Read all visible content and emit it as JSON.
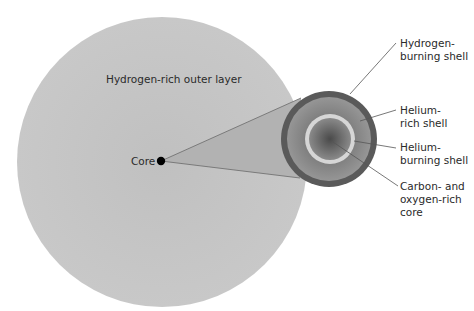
{
  "diagram": {
    "outer_layer_label": "Hydrogen-rich outer layer",
    "core_label": "Core",
    "callouts": [
      {
        "line1": "Hydrogen-",
        "line2": "burning shell",
        "line3": ""
      },
      {
        "line1": "Helium-",
        "line2": "rich shell",
        "line3": ""
      },
      {
        "line1": "Helium-",
        "line2": "burning shell",
        "line3": ""
      },
      {
        "line1": "Carbon- and",
        "line2": "oxygen-rich",
        "line3": "core"
      }
    ],
    "colors": {
      "outer_layer": "#c4c4c4",
      "cone": "#b0b0b0",
      "hydrogen_burning_shell": "#5a5a5a",
      "helium_rich_shell": "#8c8c8c",
      "helium_burning_shell": "#d8d8d8",
      "carbon_oxygen_core_center": "#4a4a4a",
      "carbon_oxygen_core_edge": "#8a8a8a",
      "leader_line": "#555555",
      "core_dot": "#000000"
    }
  }
}
